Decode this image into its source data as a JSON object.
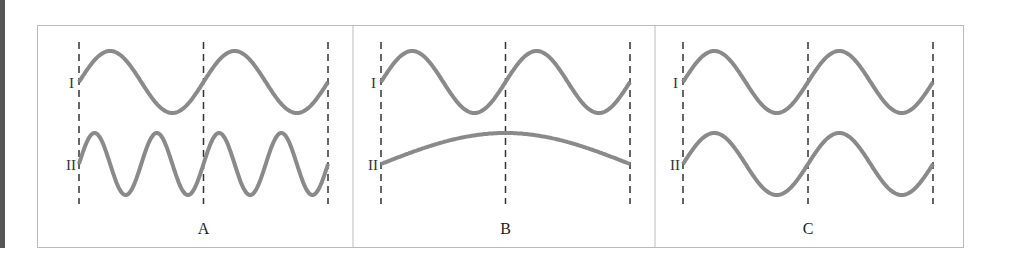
{
  "panels": [
    {
      "label": "A",
      "wave_I": {
        "cycles": 2,
        "amplitude": "equal"
      },
      "wave_II": {
        "cycles": 4,
        "amplitude": "equal"
      }
    },
    {
      "label": "B",
      "wave_I": {
        "cycles": 2,
        "amplitude": "equal"
      },
      "wave_II": {
        "cycles": 0.5,
        "amplitude": "equal"
      }
    },
    {
      "label": "C",
      "wave_I": {
        "cycles": 2,
        "amplitude": "equal"
      },
      "wave_II": {
        "cycles": 2,
        "amplitude": "equal"
      }
    }
  ],
  "wave_labels": {
    "I": "I",
    "II": "II"
  },
  "colors": {
    "wave": "#8a8a8a",
    "dash": "#333333",
    "border": "#bbbbbb"
  }
}
